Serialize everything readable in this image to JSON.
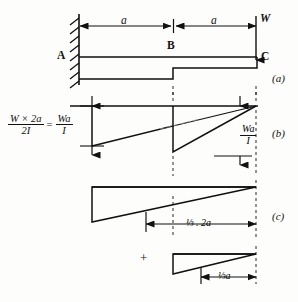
{
  "figure": {
    "ink_color": "#111111",
    "background": "#fdfdfc"
  },
  "panels": [
    {
      "id": "a",
      "tag": "(a)"
    },
    {
      "id": "b",
      "tag": "(b)"
    },
    {
      "id": "c",
      "tag": "(c)"
    }
  ],
  "panel_a": {
    "support_label": "A",
    "mid_label": "B",
    "tip_label": "C",
    "load_label": "W",
    "dimension_left": "a",
    "dimension_right": "a"
  },
  "panel_b": {
    "equation": {
      "left_numerator": "W × 2a",
      "left_denominator": "2I",
      "equals": "=",
      "right_numerator": "Wa",
      "right_denominator": "I"
    },
    "tip_value": {
      "numerator": "Wa",
      "denominator": "I"
    }
  },
  "panel_c": {
    "centroid_upper": "⅓ . 2a",
    "centroid_upper_fraction_num": "1",
    "centroid_upper_fraction_den": "3",
    "centroid_upper_rest": ". 2a",
    "plus": "+",
    "centroid_lower": "⅓a",
    "centroid_lower_fraction_num": "1",
    "centroid_lower_fraction_den": "3",
    "centroid_lower_rest": "a"
  }
}
